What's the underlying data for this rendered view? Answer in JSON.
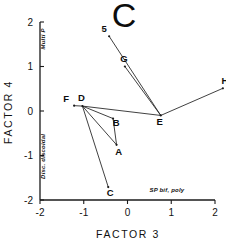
{
  "chart_data": {
    "type": "scatter",
    "title": "C",
    "xlabel": "FACTOR 3",
    "ylabel": "FACTOR 4",
    "xlim": [
      -2,
      2
    ],
    "ylim": [
      -2,
      2
    ],
    "xticks": [
      "-2",
      "-1",
      "0",
      "1",
      "2"
    ],
    "xtick_values": [
      -2,
      -1,
      0,
      1,
      2
    ],
    "yticks": [
      "2",
      "1",
      "0",
      "-1",
      "-2"
    ],
    "ytick_values": [
      2,
      1,
      0,
      -1,
      -2
    ],
    "grid": false,
    "legend": "none",
    "axis_pole_labels": [
      {
        "name": "y-axis-positive-pole",
        "text": "Multi P",
        "x": -1.88,
        "y": 1.62,
        "rotation": -90
      },
      {
        "name": "y-axis-negative-pole",
        "text": "Disc. discoidal",
        "x": -1.88,
        "y": -1.02,
        "rotation": -90
      },
      {
        "name": "x-axis-positive-pole",
        "text": "SP bif, poly",
        "x": 0.9,
        "y": -1.82,
        "rotation": 0
      }
    ],
    "points": [
      {
        "label": "5",
        "x": -0.42,
        "y": 1.68,
        "label_dx": -5,
        "label_dy": -4
      },
      {
        "label": "G",
        "x": -0.06,
        "y": 1.0,
        "label_dx": -1,
        "label_dy": -5
      },
      {
        "label": "H",
        "x": 2.18,
        "y": 0.51,
        "label_dx": 2,
        "label_dy": -4
      },
      {
        "label": "F",
        "x": -1.22,
        "y": 0.12,
        "label_dx": -8,
        "label_dy": -4
      },
      {
        "label": "D",
        "x": -1.03,
        "y": 0.11,
        "label_dx": -1,
        "label_dy": -5
      },
      {
        "label": "E",
        "x": 0.76,
        "y": -0.1,
        "label_dx": -1,
        "label_dy": 10
      },
      {
        "label": "B",
        "x": -0.33,
        "y": -0.17,
        "label_dx": 3,
        "label_dy": 7
      },
      {
        "label": "A",
        "x": -0.25,
        "y": -0.76,
        "label_dx": 2,
        "label_dy": 10
      },
      {
        "label": "C",
        "x": -0.44,
        "y": -1.71,
        "label_dx": 2,
        "label_dy": 9
      }
    ],
    "connections": [
      {
        "from": "5",
        "to": "E"
      },
      {
        "from": "G",
        "to": "E"
      },
      {
        "from": "H",
        "to": "E"
      },
      {
        "from": "D",
        "to": "E"
      },
      {
        "from": "F",
        "to": "D"
      },
      {
        "from": "D",
        "to": "B"
      },
      {
        "from": "B",
        "to": "A"
      },
      {
        "from": "D",
        "to": "A"
      },
      {
        "from": "D",
        "to": "C"
      }
    ]
  }
}
